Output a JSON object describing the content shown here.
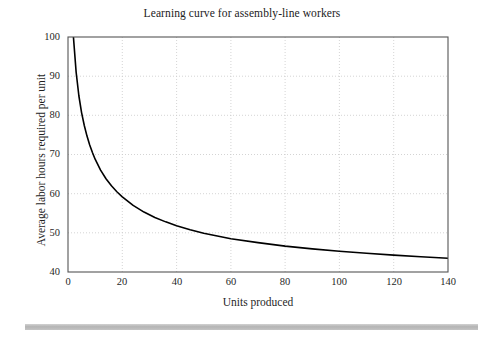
{
  "figure": {
    "background_color": "#ffffff",
    "footer_rule_color": "#b4b4b4"
  },
  "chart_data": {
    "type": "line",
    "title": "Learning curve for assembly-line workers",
    "xlabel": "Units produced",
    "ylabel": "Average labor hours required per unit",
    "xlim": [
      0,
      140
    ],
    "ylim": [
      40,
      100
    ],
    "xticks": [
      0,
      20,
      40,
      60,
      80,
      100,
      120,
      140
    ],
    "yticks": [
      40,
      50,
      60,
      70,
      80,
      90,
      100
    ],
    "grid": true,
    "grid_style": "dotted",
    "grid_color": "#c9c9c9",
    "legend": null,
    "line_color": "#000000",
    "line_width": 1.6,
    "series": [
      {
        "name": "Average labor hours per unit",
        "x": [
          2,
          3,
          4,
          5,
          6,
          7,
          8,
          9,
          10,
          12,
          14,
          16,
          18,
          20,
          24,
          28,
          32,
          36,
          40,
          45,
          50,
          55,
          60,
          70,
          80,
          90,
          100,
          110,
          120,
          130,
          140
        ],
        "values": [
          100.0,
          91.0,
          85.0,
          80.7,
          77.4,
          74.7,
          72.4,
          70.5,
          68.8,
          66.0,
          63.8,
          62.0,
          60.5,
          59.2,
          57.0,
          55.3,
          53.9,
          52.8,
          51.8,
          50.8,
          49.9,
          49.2,
          48.5,
          47.5,
          46.6,
          45.9,
          45.3,
          44.8,
          44.3,
          43.9,
          43.5
        ]
      }
    ],
    "annotations": []
  },
  "axis_labels": {
    "y": [
      "100",
      "90",
      "80",
      "70",
      "60",
      "50",
      "40"
    ],
    "x": [
      "0",
      "20",
      "40",
      "60",
      "80",
      "100",
      "120",
      "140"
    ]
  }
}
